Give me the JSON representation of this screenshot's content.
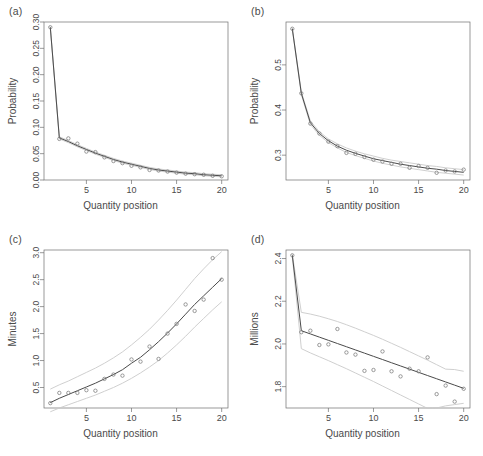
{
  "figure": {
    "background": "#ffffff",
    "axis_color": "#6e6e6e",
    "fit_color": "#4a4a4a",
    "band_color": "#c9c9c9",
    "point_color": "#7a7a7a",
    "caption_partial": ""
  },
  "panels": [
    {
      "tag": "(a)",
      "xlabel": "Quantity position",
      "ylabel": "Probability"
    },
    {
      "tag": "(b)",
      "xlabel": "Quantity position",
      "ylabel": "Probability"
    },
    {
      "tag": "(c)",
      "xlabel": "Quantity position",
      "ylabel": "Minutes"
    },
    {
      "tag": "(d)",
      "xlabel": "Quantity position",
      "ylabel": "Millions"
    }
  ],
  "chart_data": [
    {
      "type": "scatter",
      "panel": "(a)",
      "title": "",
      "xlabel": "Quantity position",
      "ylabel": "Probability",
      "xlim": [
        0.3,
        20.7
      ],
      "ylim": [
        0.0,
        0.3
      ],
      "xticks": [
        5,
        10,
        15,
        20
      ],
      "yticks": [
        0.0,
        0.05,
        0.1,
        0.15,
        0.2,
        0.25,
        0.3
      ],
      "ytick_labels": [
        "0.00",
        "0.05",
        "0.10",
        "0.15",
        "0.20",
        "0.25",
        "0.30"
      ],
      "grid": false,
      "legend": "none",
      "x": [
        1,
        2,
        3,
        4,
        5,
        6,
        7,
        8,
        9,
        10,
        11,
        12,
        13,
        14,
        15,
        16,
        17,
        18,
        19,
        20
      ],
      "points": [
        0.29,
        0.078,
        0.079,
        0.069,
        0.054,
        0.053,
        0.043,
        0.036,
        0.032,
        0.027,
        0.024,
        0.019,
        0.018,
        0.016,
        0.014,
        0.012,
        0.011,
        0.01,
        0.008,
        0.007
      ],
      "series": [
        {
          "name": "fit",
          "values": [
            0.29,
            0.08,
            0.073,
            0.065,
            0.058,
            0.051,
            0.045,
            0.039,
            0.034,
            0.03,
            0.026,
            0.022,
            0.019,
            0.017,
            0.015,
            0.013,
            0.012,
            0.01,
            0.009,
            0.008
          ]
        },
        {
          "name": "upper",
          "values": [
            0.291,
            0.082,
            0.075,
            0.067,
            0.06,
            0.053,
            0.047,
            0.041,
            0.036,
            0.032,
            0.028,
            0.024,
            0.021,
            0.019,
            0.017,
            0.015,
            0.014,
            0.012,
            0.011,
            0.01
          ]
        },
        {
          "name": "lower",
          "values": [
            0.289,
            0.078,
            0.071,
            0.063,
            0.056,
            0.049,
            0.043,
            0.037,
            0.032,
            0.028,
            0.024,
            0.02,
            0.017,
            0.015,
            0.013,
            0.011,
            0.01,
            0.008,
            0.007,
            0.006
          ]
        }
      ]
    },
    {
      "type": "scatter",
      "panel": "(b)",
      "title": "",
      "xlabel": "Quantity position",
      "ylabel": "Probability",
      "xlim": [
        0.3,
        20.7
      ],
      "ylim": [
        0.245,
        0.595
      ],
      "xticks": [
        5,
        10,
        15,
        20
      ],
      "yticks": [
        0.3,
        0.4,
        0.5
      ],
      "ytick_labels": [
        "0.3",
        "0.4",
        "0.5"
      ],
      "grid": false,
      "legend": "none",
      "x": [
        1,
        2,
        3,
        4,
        5,
        6,
        7,
        8,
        9,
        10,
        11,
        12,
        13,
        14,
        15,
        16,
        17,
        18,
        19,
        20
      ],
      "points": [
        0.58,
        0.437,
        0.37,
        0.348,
        0.33,
        0.32,
        0.305,
        0.303,
        0.296,
        0.29,
        0.286,
        0.281,
        0.281,
        0.272,
        0.276,
        0.272,
        0.261,
        0.266,
        0.264,
        0.268
      ],
      "series": [
        {
          "name": "fit",
          "values": [
            0.58,
            0.437,
            0.372,
            0.348,
            0.332,
            0.32,
            0.311,
            0.304,
            0.298,
            0.292,
            0.288,
            0.284,
            0.28,
            0.277,
            0.274,
            0.271,
            0.269,
            0.266,
            0.264,
            0.262
          ]
        },
        {
          "name": "upper",
          "values": [
            0.582,
            0.44,
            0.376,
            0.352,
            0.336,
            0.325,
            0.316,
            0.309,
            0.303,
            0.298,
            0.293,
            0.289,
            0.286,
            0.283,
            0.28,
            0.277,
            0.275,
            0.272,
            0.27,
            0.268
          ]
        },
        {
          "name": "lower",
          "values": [
            0.578,
            0.434,
            0.368,
            0.344,
            0.328,
            0.316,
            0.306,
            0.299,
            0.293,
            0.287,
            0.282,
            0.278,
            0.274,
            0.271,
            0.268,
            0.265,
            0.262,
            0.26,
            0.258,
            0.256
          ]
        }
      ]
    },
    {
      "type": "scatter",
      "panel": "(c)",
      "title": "",
      "xlabel": "Quantity position",
      "ylabel": "Minutes",
      "xlim": [
        0.3,
        20.7
      ],
      "ylim": [
        0.12,
        3.05
      ],
      "xticks": [
        5,
        10,
        15,
        20
      ],
      "yticks": [
        0.5,
        1.0,
        1.5,
        2.0,
        2.5,
        3.0
      ],
      "ytick_labels": [
        "0.5",
        "1.0",
        "1.5",
        "2.0",
        "2.5",
        "3.0"
      ],
      "grid": false,
      "legend": "none",
      "x": [
        1,
        2,
        3,
        4,
        5,
        6,
        7,
        8,
        9,
        10,
        11,
        12,
        13,
        14,
        15,
        16,
        17,
        18,
        19,
        20
      ],
      "points": [
        0.21,
        0.4,
        0.4,
        0.4,
        0.45,
        0.44,
        0.66,
        0.74,
        0.72,
        1.02,
        0.98,
        1.26,
        1.03,
        1.5,
        1.68,
        2.04,
        1.92,
        2.13,
        2.9,
        2.5
      ],
      "series": [
        {
          "name": "fit",
          "values": [
            0.22,
            0.3,
            0.37,
            0.44,
            0.51,
            0.58,
            0.66,
            0.74,
            0.83,
            0.95,
            1.06,
            1.2,
            1.35,
            1.51,
            1.68,
            1.86,
            2.04,
            2.2,
            2.36,
            2.52
          ]
        },
        {
          "name": "upper",
          "values": [
            0.47,
            0.55,
            0.62,
            0.7,
            0.78,
            0.86,
            0.95,
            1.05,
            1.16,
            1.29,
            1.43,
            1.58,
            1.75,
            1.93,
            2.12,
            2.32,
            2.52,
            2.7,
            2.87,
            3.02
          ]
        },
        {
          "name": "lower",
          "values": [
            0.05,
            0.12,
            0.18,
            0.24,
            0.3,
            0.36,
            0.43,
            0.5,
            0.58,
            0.67,
            0.77,
            0.88,
            1.0,
            1.14,
            1.29,
            1.45,
            1.62,
            1.78,
            1.94,
            2.09
          ]
        }
      ]
    },
    {
      "type": "scatter",
      "panel": "(d)",
      "title": "",
      "xlabel": "Quantity position",
      "ylabel": "Millions",
      "xlim": [
        0.3,
        20.7
      ],
      "ylim": [
        1.7,
        2.44
      ],
      "xticks": [
        5,
        10,
        15,
        20
      ],
      "yticks": [
        1.8,
        2.0,
        2.2,
        2.4
      ],
      "ytick_labels": [
        "1.8",
        "2.0",
        "2.2",
        "2.4"
      ],
      "grid": false,
      "legend": "none",
      "x": [
        1,
        2,
        3,
        4,
        5,
        6,
        7,
        8,
        9,
        10,
        11,
        12,
        13,
        14,
        15,
        16,
        17,
        18,
        19,
        20
      ],
      "points": [
        2.415,
        2.055,
        2.062,
        1.995,
        1.998,
        2.07,
        1.96,
        1.95,
        1.874,
        1.878,
        1.965,
        1.872,
        1.848,
        1.884,
        1.872,
        1.937,
        1.765,
        1.805,
        1.73,
        1.79
      ],
      "series": [
        {
          "name": "fit",
          "values": [
            2.415,
            2.062,
            2.047,
            2.032,
            2.017,
            2.002,
            1.987,
            1.972,
            1.957,
            1.942,
            1.927,
            1.912,
            1.897,
            1.882,
            1.867,
            1.852,
            1.837,
            1.822,
            1.807,
            1.792
          ]
        },
        {
          "name": "upper",
          "values": [
            2.42,
            2.148,
            2.14,
            2.13,
            2.118,
            2.105,
            2.09,
            2.074,
            2.057,
            2.04,
            2.022,
            2.003,
            1.984,
            1.964,
            1.944,
            1.924,
            1.903,
            1.882,
            1.88,
            1.872
          ]
        },
        {
          "name": "lower",
          "values": [
            2.41,
            1.978,
            1.958,
            1.94,
            1.922,
            1.903,
            1.884,
            1.864,
            1.844,
            1.824,
            1.803,
            1.782,
            1.761,
            1.74,
            1.719,
            1.698,
            1.7,
            1.71,
            1.716,
            1.722
          ]
        }
      ]
    }
  ]
}
